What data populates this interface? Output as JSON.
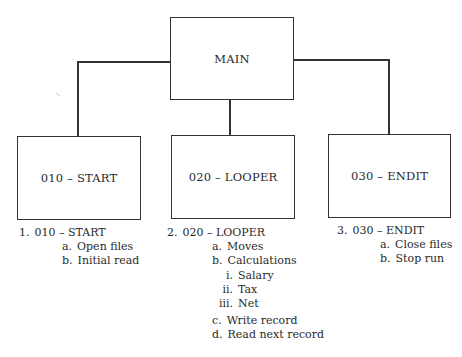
{
  "diagram": {
    "type": "hierarchy-chart",
    "root": {
      "label": "MAIN"
    },
    "children": [
      {
        "label": "010 – START"
      },
      {
        "label": "020 – LOOPER"
      },
      {
        "label": "030 – ENDIT"
      }
    ]
  },
  "outlines": [
    {
      "number": "1.",
      "title": "010 – START",
      "items": [
        {
          "marker": "a.",
          "text": "Open files"
        },
        {
          "marker": "b.",
          "text": "Initial read"
        }
      ]
    },
    {
      "number": "2.",
      "title": "020 – LOOPER",
      "items": [
        {
          "marker": "a.",
          "text": "Moves"
        },
        {
          "marker": "b.",
          "text": "Calculations",
          "subitems": [
            {
              "marker": "i.",
              "text": "Salary"
            },
            {
              "marker": "ii.",
              "text": "Tax"
            },
            {
              "marker": "iii.",
              "text": "Net"
            }
          ]
        },
        {
          "marker": "c.",
          "text": "Write record"
        },
        {
          "marker": "d.",
          "text": "Read next record"
        }
      ]
    },
    {
      "number": "3.",
      "title": "030 – ENDIT",
      "items": [
        {
          "marker": "a.",
          "text": "Close files"
        },
        {
          "marker": "b.",
          "text": "Stop run"
        }
      ]
    }
  ]
}
